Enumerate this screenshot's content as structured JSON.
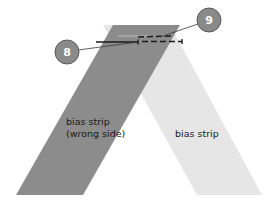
{
  "diagram": {
    "title": "",
    "colors": {
      "background": "#ffffff",
      "strip_right_side": "#e6e6e6",
      "strip_wrong_side": "#8c8c8c",
      "callout_fill": "#8a8a8a",
      "callout_stroke": "#5a5a5a",
      "stitch": "#1a1a1a"
    },
    "strips": [
      {
        "id": "light",
        "label": "bias strip",
        "side": "right side"
      },
      {
        "id": "dark",
        "label_line1": "bias strip",
        "label_line2": "(wrong side)",
        "side": "wrong side"
      }
    ],
    "callouts": [
      {
        "number": "8",
        "target": "solid stitch line"
      },
      {
        "number": "9",
        "target": "dashed stitch line"
      }
    ]
  }
}
